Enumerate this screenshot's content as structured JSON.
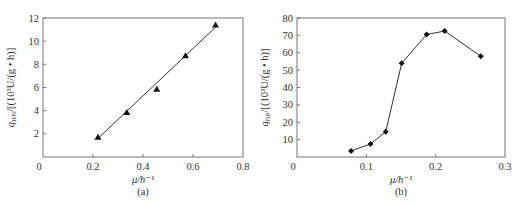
{
  "chart_data": [
    {
      "id": "a",
      "type": "scatter",
      "caption": "(a)",
      "title": "",
      "xlabel": "μ/h⁻¹",
      "ylabel": "q_HN/[(10³U/(g·h)]",
      "ylabel_main": "q",
      "ylabel_sub": "HN",
      "ylabel_rest": "/[(10³U/(g • h)]",
      "xlim": [
        0,
        0.8
      ],
      "ylim": [
        0,
        12
      ],
      "xticks": [
        "0",
        "0.2",
        "0.4",
        "0.6",
        "0.8"
      ],
      "yticks": [
        "2",
        "4",
        "6",
        "8",
        "10",
        "12"
      ],
      "xtick_values": [
        0,
        0.2,
        0.4,
        0.6,
        0.8
      ],
      "ytick_values": [
        2,
        4,
        6,
        8,
        10,
        12
      ],
      "grid": false,
      "marker": "triangle",
      "series": [
        {
          "name": "measured",
          "x": [
            0.22,
            0.335,
            0.455,
            0.57,
            0.69
          ],
          "y": [
            1.7,
            3.85,
            5.85,
            8.75,
            11.4
          ]
        }
      ],
      "fit_line": {
        "x": [
          0.22,
          0.69
        ],
        "y": [
          1.6,
          11.2
        ]
      }
    },
    {
      "id": "b",
      "type": "line",
      "caption": "(b)",
      "title": "",
      "xlabel": "μ/h⁻¹",
      "ylabel": "q_NP/[(10³U/(g·h)]",
      "ylabel_main": "q",
      "ylabel_sub": "NP",
      "ylabel_rest": "/[(10³U/(g • h)]",
      "xlim": [
        0,
        0.3
      ],
      "ylim": [
        0,
        80
      ],
      "xticks": [
        "0",
        "0.1",
        "0.2",
        "0.3"
      ],
      "yticks": [
        "10",
        "20",
        "30",
        "40",
        "50",
        "60",
        "70",
        "80"
      ],
      "xtick_values": [
        0,
        0.1,
        0.2,
        0.3
      ],
      "ytick_values": [
        10,
        20,
        30,
        40,
        50,
        60,
        70,
        80
      ],
      "grid": false,
      "marker": "diamond",
      "series": [
        {
          "name": "measured",
          "x": [
            0.078,
            0.106,
            0.128,
            0.151,
            0.187,
            0.213,
            0.265
          ],
          "y": [
            3.5,
            7.5,
            14.5,
            54,
            70.5,
            72.5,
            58
          ]
        }
      ]
    }
  ]
}
